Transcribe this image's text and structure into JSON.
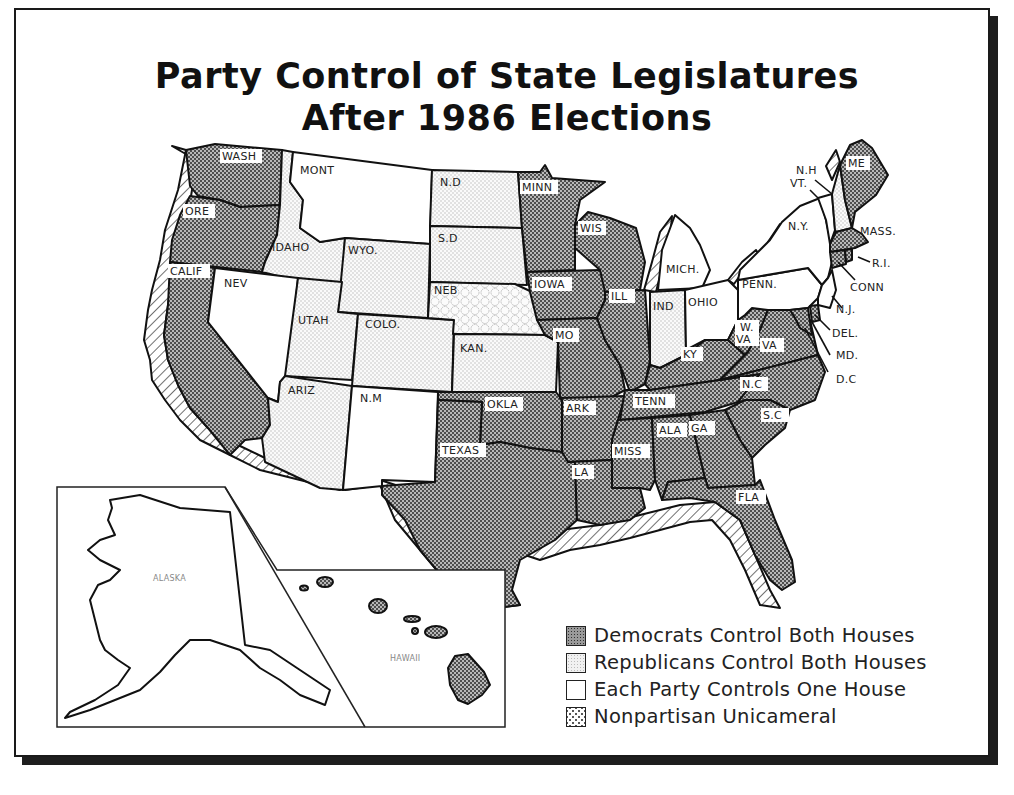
{
  "title": {
    "line1": "Party Control of State Legislatures",
    "line2": "After 1986 Elections"
  },
  "legend": [
    {
      "key": "dem",
      "label": "Democrats Control Both Houses",
      "pattern": "dense-dot-dark",
      "color": "#8c8c8c"
    },
    {
      "key": "rep",
      "label": "Republicans Control Both Houses",
      "pattern": "light-dot",
      "color": "#eeeeee"
    },
    {
      "key": "split",
      "label": "Each Party Controls One House",
      "pattern": "blank",
      "color": "#ffffff"
    },
    {
      "key": "np",
      "label": "Nonpartisan Unicameral",
      "pattern": "hex-circles",
      "color": "#ffffff"
    }
  ],
  "states": {
    "wash": {
      "label": "WASH",
      "control": "dem"
    },
    "ore": {
      "label": "ORE",
      "control": "dem"
    },
    "calif": {
      "label": "CALIF",
      "control": "dem"
    },
    "idaho": {
      "label": "IDAHO",
      "control": "rep"
    },
    "nev": {
      "label": "NEV",
      "control": "split"
    },
    "mont": {
      "label": "MONT",
      "control": "split"
    },
    "wyo": {
      "label": "WYO.",
      "control": "rep"
    },
    "utah": {
      "label": "UTAH",
      "control": "rep"
    },
    "colo": {
      "label": "COLO.",
      "control": "rep"
    },
    "ariz": {
      "label": "ARIZ",
      "control": "rep"
    },
    "nm": {
      "label": "N.M",
      "control": "split"
    },
    "nd": {
      "label": "N.D",
      "control": "rep"
    },
    "sd": {
      "label": "S.D",
      "control": "rep"
    },
    "neb": {
      "label": "NEB",
      "control": "np"
    },
    "kan": {
      "label": "KAN.",
      "control": "rep"
    },
    "okla": {
      "label": "OKLA",
      "control": "dem"
    },
    "texas": {
      "label": "TEXAS",
      "control": "dem"
    },
    "minn": {
      "label": "MINN",
      "control": "dem"
    },
    "iowa": {
      "label": "IOWA",
      "control": "dem"
    },
    "mo": {
      "label": "MO",
      "control": "dem"
    },
    "ark": {
      "label": "ARK",
      "control": "dem"
    },
    "la": {
      "label": "LA",
      "control": "dem"
    },
    "wis": {
      "label": "WIS",
      "control": "dem"
    },
    "ill": {
      "label": "ILL",
      "control": "dem"
    },
    "mich": {
      "label": "MICH.",
      "control": "split"
    },
    "ind": {
      "label": "IND",
      "control": "rep"
    },
    "ohio": {
      "label": "OHIO",
      "control": "split"
    },
    "ky": {
      "label": "KY",
      "control": "dem"
    },
    "tenn": {
      "label": "TENN",
      "control": "dem"
    },
    "miss": {
      "label": "MISS",
      "control": "dem"
    },
    "ala": {
      "label": "ALA",
      "control": "dem"
    },
    "ga": {
      "label": "GA",
      "control": "dem"
    },
    "fla": {
      "label": "FLA",
      "control": "dem"
    },
    "sc": {
      "label": "S.C",
      "control": "dem"
    },
    "nc": {
      "label": "N.C",
      "control": "dem"
    },
    "va": {
      "label": "VA",
      "control": "dem"
    },
    "wva": {
      "label": "W. VA",
      "control": "dem"
    },
    "penn": {
      "label": "PENN.",
      "control": "split"
    },
    "ny": {
      "label": "N.Y.",
      "control": "split"
    },
    "vt": {
      "label": "VT.",
      "control": "split"
    },
    "nh": {
      "label": "N.H",
      "control": "rep"
    },
    "me": {
      "label": "ME",
      "control": "dem"
    },
    "mass": {
      "label": "MASS.",
      "control": "dem"
    },
    "ri": {
      "label": "R.I.",
      "control": "dem"
    },
    "conn": {
      "label": "CONN",
      "control": "dem"
    },
    "nj": {
      "label": "N.J.",
      "control": "split"
    },
    "del": {
      "label": "DEL.",
      "control": "dem"
    },
    "md": {
      "label": "MD.",
      "control": "dem"
    },
    "dc": {
      "label": "D.C",
      "control": "dem"
    },
    "alaska": {
      "label": "ALASKA",
      "control": "split"
    },
    "hawaii": {
      "label": "HAWAII",
      "control": "dem"
    }
  }
}
